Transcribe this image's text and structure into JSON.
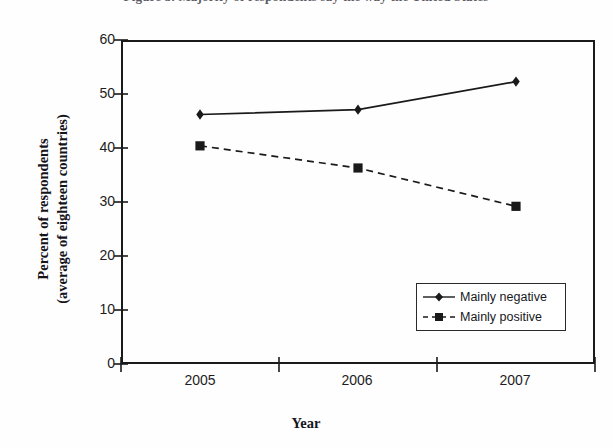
{
  "figure": {
    "title_cutoff": "Figure 3. Majority of respondents say the way the United States",
    "background": "#fefefe",
    "ink_color": "#1a1a1a"
  },
  "chart_data": {
    "type": "line",
    "title": "",
    "xlabel": "Year",
    "ylabel": "Percent of respondents (average of eighteen countries)",
    "ylabel_line1": "Percent of respondents",
    "ylabel_line2": "(average of eighteen countries)",
    "categories": [
      "2005",
      "2006",
      "2007"
    ],
    "x": [
      2005,
      2006,
      2007
    ],
    "ylim": [
      0,
      60
    ],
    "yticks": [
      0,
      10,
      20,
      30,
      40,
      50,
      60
    ],
    "ytick_labels": [
      "0",
      "10",
      "20",
      "30",
      "40",
      "50",
      "60"
    ],
    "xtick_labels": [
      "2005",
      "2006",
      "2007"
    ],
    "grid": false,
    "legend_position": "bottom-right",
    "series": [
      {
        "name": "Mainly negative",
        "values": [
          46.2,
          47.1,
          52.3
        ],
        "line_style": "solid",
        "marker": "diamond",
        "color": "#1a1a1a"
      },
      {
        "name": "Mainly positive",
        "values": [
          40.4,
          36.3,
          29.2
        ],
        "line_style": "dashed",
        "marker": "square",
        "color": "#1a1a1a"
      }
    ]
  },
  "legend": {
    "items": [
      {
        "label": "Mainly negative",
        "marker": "diamond",
        "line_style": "solid"
      },
      {
        "label": "Mainly positive",
        "marker": "square",
        "line_style": "dashed"
      }
    ]
  }
}
